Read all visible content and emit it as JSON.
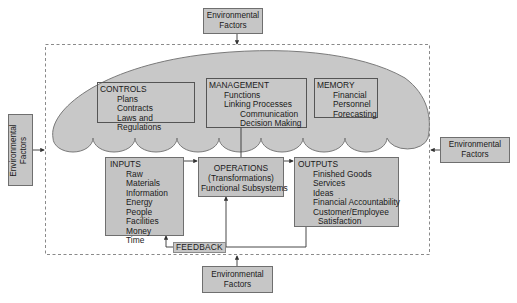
{
  "diagram": {
    "environment": {
      "top": {
        "line1": "Environmental",
        "line2": "Factors"
      },
      "left": {
        "line1": "Environmental",
        "line2": "Factors"
      },
      "right": {
        "line1": "Environmental",
        "line2": "Factors"
      },
      "bottom": {
        "line1": "Environmental",
        "line2": "Factors"
      }
    },
    "controls": {
      "title": "CONTROLS",
      "items": [
        "Plans",
        "Contracts",
        "Laws and Regulations"
      ]
    },
    "management": {
      "title": "MANAGEMENT",
      "items": [
        "Functions",
        "Linking Processes"
      ],
      "subitems": [
        "Communication",
        "Decision Making"
      ]
    },
    "memory": {
      "title": "MEMORY",
      "items": [
        "Financial",
        "Personnel",
        "Forecasting"
      ]
    },
    "inputs": {
      "title": "INPUTS",
      "items": [
        "Raw Materials",
        "Information",
        "Energy",
        "People",
        "Facilities",
        "Money",
        "Time"
      ]
    },
    "operations": {
      "title": "OPERATIONS",
      "line2": "(Transformations)",
      "line3": "Functional Subsystems"
    },
    "outputs": {
      "title": "OUTPUTS",
      "items": [
        "Finished Goods",
        "Services",
        "Ideas",
        "Financial Accountability",
        "Customer/Employee"
      ],
      "continuation": "Satisfaction"
    },
    "feedback": {
      "label": "FEEDBACK"
    },
    "colors": {
      "box_fill": "#c4c4c4",
      "cloud_fill": "#c8c8c8",
      "border": "#6f6f6f",
      "dashed": "#8a8a8a"
    }
  }
}
